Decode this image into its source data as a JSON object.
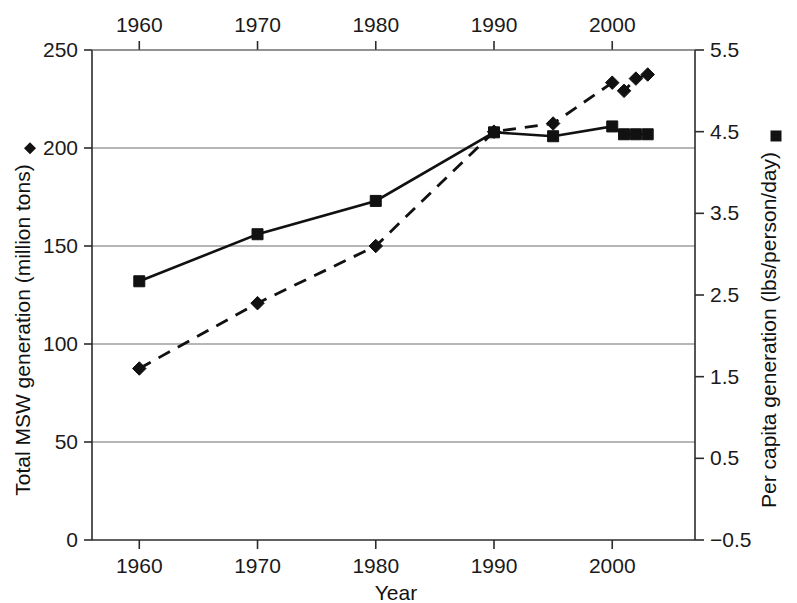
{
  "chart_data": {
    "type": "line",
    "title": "",
    "subtitle": "",
    "xlabel": "Year",
    "ylabel": "Total MSW generation (million tons)",
    "y2label": "Per capita generation (lbs/person/day)",
    "xlim": [
      1956,
      2007
    ],
    "ylim": [
      0,
      250
    ],
    "y2lim": [
      -0.5,
      5.5
    ],
    "grid": true,
    "grid_axis": "y",
    "legend": "inline-with-axis-titles",
    "x_ticks": [
      1960,
      1970,
      1980,
      1990,
      2000
    ],
    "x_tick_labels": [
      "1960",
      "1970",
      "1980",
      "1990",
      "2000"
    ],
    "x_tick_labels_top": [
      "1960",
      "1970",
      "1980",
      "1990",
      "2000"
    ],
    "y_ticks": [
      0,
      50,
      100,
      150,
      200,
      250
    ],
    "y_tick_labels": [
      "0",
      "50",
      "100",
      "150",
      "200",
      "250"
    ],
    "y2_ticks": [
      -0.5,
      0.5,
      1.5,
      2.5,
      3.5,
      4.5,
      5.5
    ],
    "y2_tick_labels": [
      "−0.5",
      "0.5",
      "1.5",
      "2.5",
      "3.5",
      "4.5",
      "5.5"
    ],
    "x": [
      1960,
      1970,
      1980,
      1990,
      1995,
      2000,
      2001,
      2002,
      2003
    ],
    "series": [
      {
        "name": "Total MSW generation (million tons)",
        "axis": "left",
        "marker": "square",
        "linestyle": "solid",
        "color": "#111111",
        "values": [
          132,
          156,
          173,
          208,
          206,
          211,
          207,
          207,
          207
        ]
      },
      {
        "name": "Per capita generation (lbs/person/day)",
        "axis": "right",
        "marker": "diamond",
        "linestyle": "dashed",
        "color": "#111111",
        "values": [
          1.6,
          2.4,
          3.1,
          4.5,
          4.6,
          5.1,
          5.0,
          5.15,
          5.2
        ]
      }
    ]
  },
  "legend_markers": {
    "left_axis_marker": "diamond-marker",
    "right_axis_marker": "square-marker"
  }
}
